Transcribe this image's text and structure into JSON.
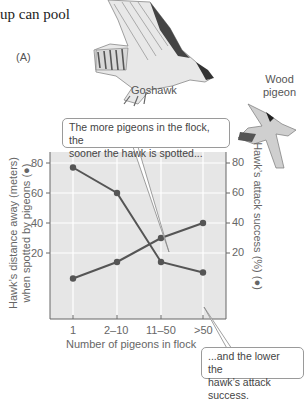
{
  "heading_fragment": "up can pool",
  "panel_label": "(A)",
  "birds": {
    "hawk_label": "Goshawk",
    "pigeon_label_line1": "Wood",
    "pigeon_label_line2": "pigeon"
  },
  "callouts": {
    "top": {
      "line1": "The more pigeons in the flock, the",
      "line2": "sooner the hawk is spotted..."
    },
    "bottom": {
      "line1": "...and the lower the",
      "line2": "hawk’s attack success."
    }
  },
  "axes": {
    "left_title_line1": "Hawk’s distance away (meters)",
    "left_title_line2": "when spotted by pigeons (●)",
    "right_title": "Hawk’s attack success (%) (●)",
    "x_title": "Number of pigeons in flock",
    "left_ticks": [
      "80",
      "60",
      "40",
      "20"
    ],
    "right_ticks": [
      "80",
      "60",
      "40",
      "20"
    ],
    "x_ticks": [
      "1",
      "2–10",
      "11–50",
      ">50"
    ]
  },
  "colors": {
    "plot_bg": "#e6e6e6",
    "grid": "#ffffff",
    "series": "#555555",
    "axis": "#666666"
  },
  "chart_data": {
    "type": "line",
    "title": "",
    "categories": [
      "1",
      "2–10",
      "11–50",
      ">50"
    ],
    "xlabel": "Number of pigeons in flock",
    "ylabel": "Hawk’s distance away (meters) when spotted by pigeons",
    "ylabel_right": "Hawk’s attack success (%)",
    "ylim": [
      0,
      80
    ],
    "ylim_right": [
      0,
      80
    ],
    "yticks": [
      20,
      40,
      60,
      80
    ],
    "grid": true,
    "series": [
      {
        "name": "Hawk’s distance away when spotted (m)",
        "axis": "left",
        "values": [
          77,
          60,
          14,
          7
        ]
      },
      {
        "name": "Hawk’s attack success (%)",
        "axis": "right",
        "values": [
          3,
          14,
          30,
          40
        ]
      }
    ],
    "annotations": [
      "The more pigeons in the flock, the sooner the hawk is spotted...",
      "...and the lower the hawk’s attack success."
    ]
  }
}
